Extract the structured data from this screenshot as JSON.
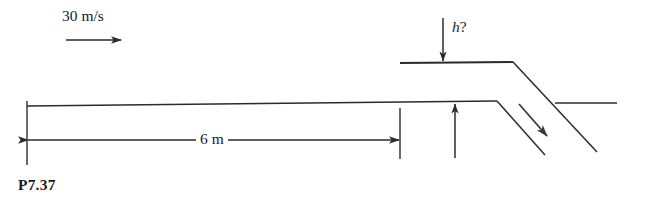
{
  "figure": {
    "caption": "P7.37",
    "stroke_color": "#2b2b2b",
    "background_color": "#ffffff",
    "labels": {
      "velocity": "30 m/s",
      "height_query_symbol": "h",
      "height_query_mark": "?",
      "span_dimension": "6 m"
    },
    "geometry": {
      "main_surface_line": {
        "x1": 27,
        "y1": 106,
        "x2": 497,
        "y2": 101
      },
      "upper_plate_line": {
        "x1": 400,
        "y1": 63,
        "x2": 513,
        "y2": 62
      },
      "upper_chute_wall": {
        "x1": 513,
        "y1": 62,
        "x2": 597,
        "y2": 152
      },
      "lower_chute_wall": {
        "x1": 497,
        "y1": 101,
        "x2": 545,
        "y2": 155
      },
      "right_surface_line": {
        "x1": 555,
        "y1": 103,
        "x2": 617,
        "y2": 103
      },
      "dimension_line_y": 140,
      "extension_left_x": 27,
      "extension_right_x": 400,
      "level_arrow_x": 455,
      "height_arrow_x": 443,
      "velocity_arrow": {
        "x1": 66,
        "y1": 40,
        "x2": 121,
        "y2": 40
      },
      "flow_arrow": {
        "x1": 519,
        "y1": 104,
        "x2": 547,
        "y2": 136
      }
    }
  }
}
